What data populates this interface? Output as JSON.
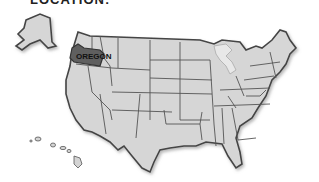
{
  "header": {
    "title": "LOCATION:"
  },
  "map": {
    "region": "United States",
    "highlighted_state": {
      "name": "Oregon",
      "label": "OREGON",
      "color": "#5f5f5f"
    },
    "base_fill": "#d4d4d4",
    "border_color": "#444444",
    "insets": [
      "Alaska",
      "Hawaii"
    ]
  }
}
